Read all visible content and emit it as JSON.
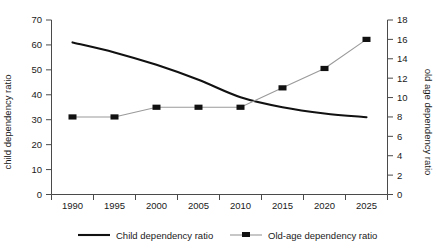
{
  "chart_data": {
    "type": "line",
    "title": "",
    "xlabel": "",
    "x": [
      1990,
      1995,
      2000,
      2005,
      2010,
      2015,
      2020,
      2025
    ],
    "categories": [
      "1990",
      "1995",
      "2000",
      "2005",
      "2010",
      "2015",
      "2020",
      "2025"
    ],
    "grid": false,
    "legend_position": "bottom",
    "axes": {
      "left": {
        "label": "child dependency ratio",
        "min": 0,
        "max": 70,
        "step": 10,
        "ticks": [
          "0",
          "10",
          "20",
          "30",
          "40",
          "50",
          "60",
          "70"
        ]
      },
      "right": {
        "label": "old age dependency ratio",
        "min": 0,
        "max": 18,
        "step": 2,
        "ticks": [
          "0",
          "2",
          "4",
          "6",
          "8",
          "10",
          "12",
          "14",
          "16",
          "18"
        ]
      },
      "bottom": {
        "ticks": [
          "1990",
          "1995",
          "2000",
          "2005",
          "2010",
          "2015",
          "2020",
          "2025"
        ]
      }
    },
    "series": [
      {
        "name": "Child dependency ratio",
        "axis": "left",
        "marker": "none",
        "color": "#111111",
        "values": [
          61,
          57,
          52,
          46,
          39,
          35,
          32.5,
          31
        ]
      },
      {
        "name": "Old-age dependency ratio",
        "axis": "right",
        "marker": "square",
        "color": "#9a9a9a",
        "marker_color": "#111111",
        "values": [
          8,
          8,
          9,
          9,
          9,
          11,
          13,
          16
        ]
      }
    ]
  },
  "legend": {
    "items": [
      {
        "label": "Child dependency ratio",
        "style": "line"
      },
      {
        "label": "Old-age dependency ratio",
        "style": "line-marker"
      }
    ]
  }
}
